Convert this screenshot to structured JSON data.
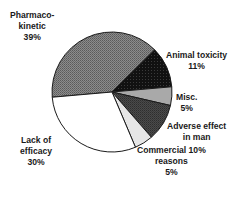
{
  "chart_data": {
    "type": "pie",
    "title": "",
    "center": [
      112,
      92
    ],
    "radius": 60,
    "start_angle_deg": 175,
    "slices": [
      {
        "name": "Pharmacokinetic",
        "label_lines": [
          "Pharmaco-",
          "kinetic",
          "39%"
        ],
        "value": 39,
        "fill": "pattern-medgray"
      },
      {
        "name": "Animal toxicity",
        "label_lines": [
          "Animal toxicity",
          "11%"
        ],
        "value": 11,
        "fill": "pattern-black"
      },
      {
        "name": "Misc.",
        "label_lines": [
          "Misc.",
          "5%"
        ],
        "value": 5,
        "fill": "#a9a9a9"
      },
      {
        "name": "Adverse effect in man",
        "label_lines": [
          "Adverse effect",
          "in man"
        ],
        "value": 10,
        "fill": "pattern-darkgray"
      },
      {
        "name": "Commercial reasons",
        "label_lines": [
          "Commercial 10%",
          "reasons",
          "5%"
        ],
        "value": 5,
        "fill": "#e6e6e6"
      },
      {
        "name": "Lack of efficacy",
        "label_lines": [
          "Lack of",
          "efficacy",
          "30%"
        ],
        "value": 30,
        "fill": "#ffffff"
      }
    ]
  },
  "labels": {
    "pharmaco": {
      "l1": "Pharmaco-",
      "l2": "kinetic",
      "l3": "39%"
    },
    "animal": {
      "l1": "Animal toxicity",
      "l2": "11%"
    },
    "misc": {
      "l1": "Misc.",
      "l2": "5%"
    },
    "adverse": {
      "l1": "Adverse effect",
      "l2": "in man"
    },
    "commercial": {
      "l1": "Commercial 10%",
      "l2": "reasons",
      "l3": "5%"
    },
    "lack": {
      "l1": "Lack of",
      "l2": "efficacy",
      "l3": "30%"
    }
  }
}
